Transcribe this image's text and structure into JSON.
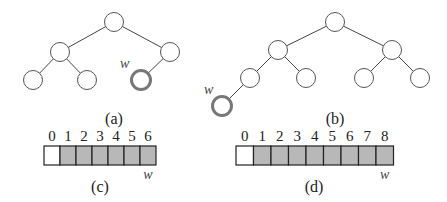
{
  "colors": {
    "node_stroke": "#555555",
    "highlight_stroke": "#777777",
    "cell_filled": "#b8b8b8",
    "cell_empty": "#ffffff"
  },
  "trees": [
    {
      "caption": "(a)",
      "caption_pos": [
        114,
        124
      ],
      "nodes": [
        [
          114,
          22
        ],
        [
          60,
          52
        ],
        [
          170,
          52
        ],
        [
          33,
          80
        ],
        [
          87,
          80
        ],
        [
          141,
          80
        ]
      ],
      "edges": [
        [
          0,
          1
        ],
        [
          0,
          2
        ],
        [
          1,
          3
        ],
        [
          1,
          4
        ],
        [
          2,
          5
        ]
      ],
      "highlight": 5,
      "w_label": "w",
      "w_pos": [
        120,
        68
      ]
    },
    {
      "caption": "(b)",
      "caption_pos": [
        335,
        124
      ],
      "nodes": [
        [
          335,
          22
        ],
        [
          278,
          50
        ],
        [
          392,
          50
        ],
        [
          250,
          78
        ],
        [
          306,
          78
        ],
        [
          364,
          78
        ],
        [
          420,
          78
        ],
        [
          222,
          106
        ]
      ],
      "edges": [
        [
          0,
          1
        ],
        [
          0,
          2
        ],
        [
          1,
          3
        ],
        [
          1,
          4
        ],
        [
          2,
          5
        ],
        [
          2,
          6
        ],
        [
          3,
          7
        ]
      ],
      "highlight": 7,
      "w_label": "w",
      "w_pos": [
        204,
        94
      ]
    }
  ],
  "arrays": [
    {
      "caption": "(c)",
      "x": 44,
      "y": 146,
      "cell_w": 16,
      "cell_h": 19,
      "indices": [
        "0",
        "1",
        "2",
        "3",
        "4",
        "5",
        "6"
      ],
      "filled": [
        false,
        true,
        true,
        true,
        true,
        true,
        true
      ],
      "w_label": "w",
      "w_index": 6,
      "caption_pos": [
        100,
        192
      ]
    },
    {
      "caption": "(d)",
      "x": 236,
      "y": 146,
      "cell_w": 17.5,
      "cell_h": 19,
      "indices": [
        "0",
        "1",
        "2",
        "3",
        "4",
        "5",
        "6",
        "7",
        "8"
      ],
      "filled": [
        false,
        true,
        true,
        true,
        true,
        true,
        true,
        true,
        true
      ],
      "w_label": "w",
      "w_index": 8,
      "caption_pos": [
        314,
        192
      ]
    }
  ]
}
